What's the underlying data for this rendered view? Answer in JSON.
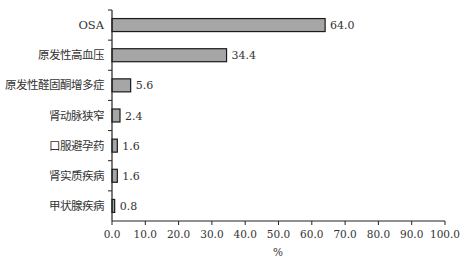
{
  "chart_data": {
    "type": "bar",
    "orientation": "horizontal",
    "title": "",
    "xlabel": "%",
    "ylabel": "",
    "xlim": [
      0,
      100
    ],
    "xticks": [
      "0.0",
      "10.0",
      "20.0",
      "30.0",
      "40.0",
      "50.0",
      "60.0",
      "70.0",
      "80.0",
      "90.0",
      "100.0"
    ],
    "grid": false,
    "legend": null,
    "categories": [
      "OSA",
      "原发性高血压",
      "原发性醛固酮增多症",
      "肾动脉狭窄",
      "口服避孕药",
      "肾实质疾病",
      "甲状腺疾病"
    ],
    "values": [
      64.0,
      34.4,
      5.6,
      2.4,
      1.6,
      1.6,
      0.8
    ],
    "value_labels": [
      "64.0",
      "34.4",
      "5.6",
      "2.4",
      "1.6",
      "1.6",
      "0.8"
    ],
    "bar_color": "#a6a6a6",
    "bar_edge_color": "#1a1a1a"
  }
}
